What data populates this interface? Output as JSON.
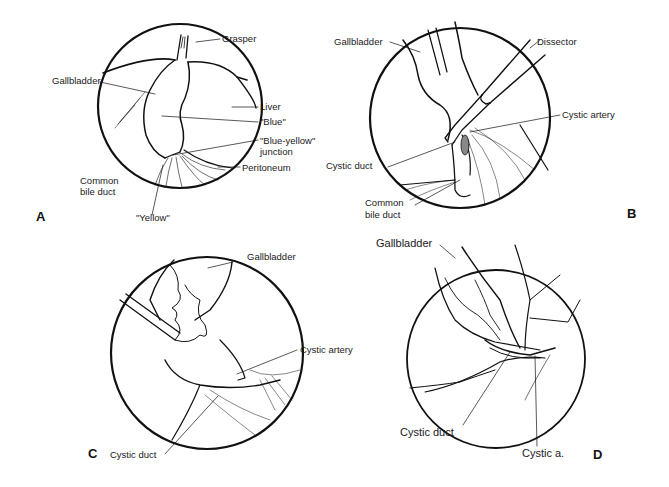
{
  "figure": {
    "panels": [
      {
        "id": "A",
        "letter": "A",
        "labels": {
          "grasper": "Grasper",
          "gallbladder": "Gallbladder",
          "liver": "Liver",
          "blue": "\"Blue\"",
          "blue_yellow_1": "\"Blue-yellow\"",
          "blue_yellow_2": "junction",
          "peritoneum": "Peritoneum",
          "cbd_1": "Common",
          "cbd_2": "bile duct",
          "yellow": "\"Yellow\""
        }
      },
      {
        "id": "B",
        "letter": "B",
        "labels": {
          "gallbladder": "Gallbladder",
          "dissector": "Dissector",
          "cystic_artery": "Cystic artery",
          "cystic_duct": "Cystic duct",
          "cbd_1": "Common",
          "cbd_2": "bile duct"
        }
      },
      {
        "id": "C",
        "letter": "C",
        "labels": {
          "gallbladder": "Gallbladder",
          "cystic_artery": "Cystic artery",
          "cystic_duct": "Cystic duct"
        }
      },
      {
        "id": "D",
        "letter": "D",
        "labels": {
          "gallbladder": "Gallbladder",
          "cystic_duct": "Cystic duct",
          "cystic_a": "Cystic a."
        }
      }
    ]
  }
}
